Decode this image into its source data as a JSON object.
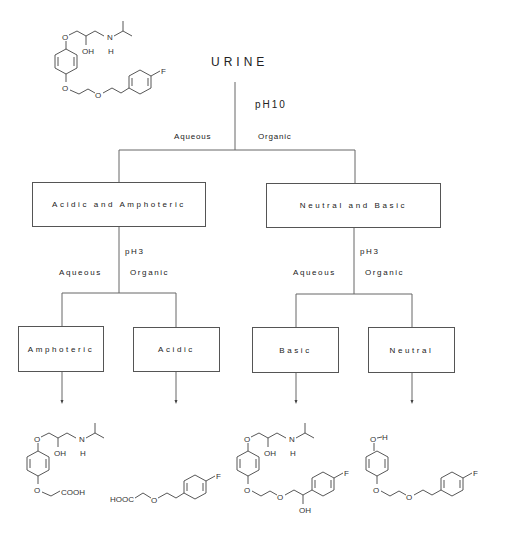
{
  "diagram": {
    "title": "URINE",
    "first_extraction": {
      "condition": "pH10",
      "left_phase": "Aqueous",
      "right_phase": "Organic"
    },
    "level1": [
      {
        "label": "Acidic and Amphoteric",
        "condition": "pH3",
        "left_phase": "Aqueous",
        "right_phase": "Organic",
        "children": [
          {
            "label": "Amphoteric",
            "structure": "amphoteric-metabolite"
          },
          {
            "label": "Acidic",
            "structure": "acidic-metabolite"
          }
        ]
      },
      {
        "label": "Neutral and Basic",
        "condition": "pH3",
        "left_phase": "Aqueous",
        "right_phase": "Organic",
        "children": [
          {
            "label": "Basic",
            "structure": "basic-metabolite"
          },
          {
            "label": "Neutral",
            "structure": "neutral-metabolite"
          }
        ]
      }
    ],
    "parent_structure": {
      "name": "parent-drug",
      "atoms": [
        "O",
        "OH",
        "N",
        "H",
        "O",
        "O",
        "F"
      ]
    },
    "structure_labels": {
      "O": "O",
      "OH": "OH",
      "N": "N",
      "H": "H",
      "F": "F",
      "COOH": "COOH",
      "HOOC": "HOOC"
    }
  }
}
